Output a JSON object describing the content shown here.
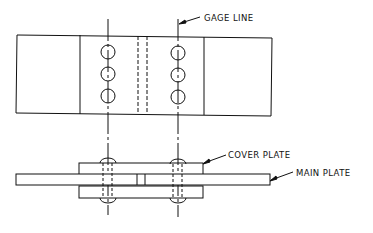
{
  "diagram": {
    "type": "riveted butt joint drawing",
    "views": [
      "plan-view",
      "section-view"
    ],
    "labels": {
      "gage_line": "GAGE LINE",
      "cover_plate": "COVER PLATE",
      "main_plate": "MAIN PLATE"
    },
    "rivet_rows": 2,
    "rivets_per_row": 3,
    "colors": {
      "line": "#111111",
      "background": "#ffffff"
    }
  }
}
